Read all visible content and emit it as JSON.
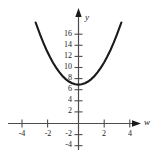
{
  "chart_data": {
    "type": "line",
    "title": "",
    "xlabel": "w",
    "ylabel": "y",
    "equation": "y = w^2 + 7",
    "grid": false,
    "legend": null,
    "xlim": [
      -5.0,
      4.8
    ],
    "ylim": [
      -5.0,
      18.5
    ],
    "x_ticks": [
      -4,
      -2,
      2,
      4
    ],
    "x_tick_labels": [
      "-4",
      "-2",
      "2",
      "4"
    ],
    "y_ticks": [
      -4,
      -2,
      2,
      4,
      6,
      8,
      10,
      12,
      14,
      16
    ],
    "y_tick_labels": [
      "-4",
      "-2",
      "2",
      "4",
      "6",
      "8",
      "10",
      "12",
      "14",
      "16"
    ],
    "vertex": [
      0,
      7
    ],
    "x": [
      -3.35,
      -3.0,
      -2.75,
      -2.5,
      -2.25,
      -2.0,
      -1.75,
      -1.5,
      -1.25,
      -1.0,
      -0.75,
      -0.5,
      -0.25,
      0,
      0.25,
      0.5,
      0.75,
      1.0,
      1.25,
      1.5,
      1.75,
      2.0,
      2.25,
      2.5,
      2.75,
      3.0,
      3.35
    ],
    "values": [
      18.2,
      16.0,
      14.56,
      13.25,
      12.06,
      11.0,
      10.06,
      9.25,
      8.56,
      8.0,
      7.56,
      7.25,
      7.06,
      7.0,
      7.06,
      7.25,
      7.56,
      8.0,
      8.56,
      9.25,
      10.06,
      11.0,
      12.06,
      13.25,
      14.56,
      16.0,
      18.2
    ],
    "curve_color": "#1a1a1a",
    "axis_color": "#4d4d4d"
  },
  "axis_labels": {
    "x_name": "w",
    "y_name": "y"
  }
}
